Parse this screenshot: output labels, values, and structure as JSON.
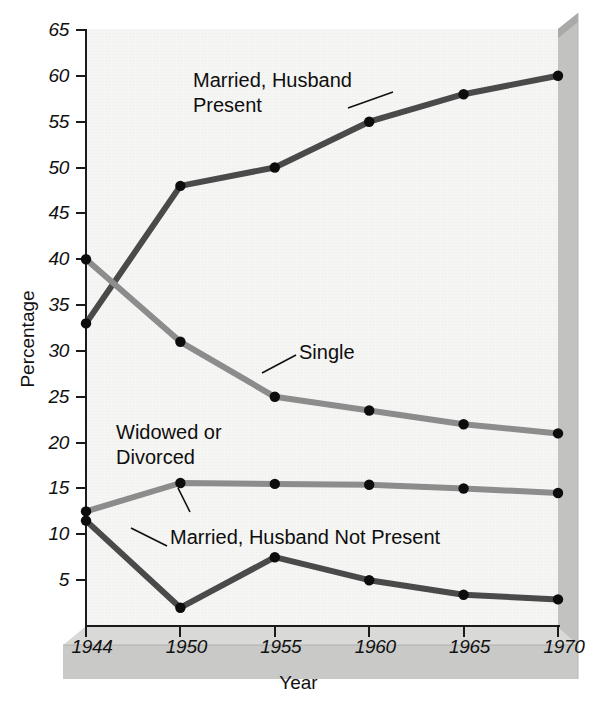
{
  "figure": {
    "background_color": "#ffffff",
    "plot_background_color": "#f6f6f4",
    "base_color": "#c9c9c7",
    "base_top_color": "#d7d7d5",
    "bevel_color": "#b4b4b2",
    "axis_color": "#1a1a1a"
  },
  "chart_data": {
    "type": "line",
    "title": "",
    "xlabel": "Year",
    "ylabel": "Percentage",
    "x": [
      1944,
      1950,
      1955,
      1960,
      1965,
      1970
    ],
    "categories": [
      "1944",
      "1950",
      "1955",
      "1960",
      "1965",
      "1970"
    ],
    "xtick_labels": [
      "1944",
      "1950",
      "1955",
      "1960",
      "1965",
      "1970"
    ],
    "ytick_labels": [
      "5",
      "10",
      "15",
      "20",
      "25",
      "30",
      "35",
      "40",
      "45",
      "50",
      "55",
      "60",
      "65"
    ],
    "ytick_values": [
      5,
      10,
      15,
      20,
      25,
      30,
      35,
      40,
      45,
      50,
      55,
      60,
      65
    ],
    "ylim": [
      0,
      65
    ],
    "xlim": [
      1944,
      1970
    ],
    "grid": false,
    "legend": "inline-annotations",
    "markers": "filled-circle",
    "series": [
      {
        "name": "Married, Husband Present",
        "color": "#4a4a4a",
        "values": [
          33,
          48,
          50,
          55,
          58,
          60
        ],
        "label_text": "Married, Husband\nPresent"
      },
      {
        "name": "Single",
        "color": "#8c8c8c",
        "values": [
          40,
          31,
          25,
          23.5,
          22,
          21
        ],
        "label_text": "Single"
      },
      {
        "name": "Widowed or Divorced",
        "color": "#8c8c8c",
        "values": [
          12.5,
          15.6,
          15.5,
          15.4,
          15,
          14.5
        ],
        "label_text": "Widowed or\nDivorced"
      },
      {
        "name": "Married, Husband Not Present",
        "color": "#4a4a4a",
        "values": [
          11.5,
          2,
          7.5,
          5,
          3.4,
          2.9
        ],
        "label_text": "Married, Husband Not Present"
      }
    ],
    "annotations": [
      {
        "name": "married-husband-present",
        "text": "Married, Husband\nPresent"
      },
      {
        "name": "single",
        "text": "Single"
      },
      {
        "name": "widowed-or-divorced",
        "text": "Widowed or\nDivorced"
      },
      {
        "name": "married-husband-not-present",
        "text": "Married, Husband Not Present"
      }
    ]
  }
}
